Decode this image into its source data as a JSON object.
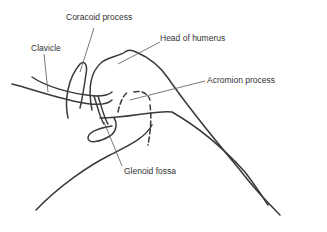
{
  "diagram": {
    "labels": [
      {
        "id": "coracoid",
        "text": "Coracoid process"
      },
      {
        "id": "clavicle",
        "text": "Clavicle"
      },
      {
        "id": "head-humerus",
        "text": "Head of humerus"
      },
      {
        "id": "acromion",
        "text": "Acromion process"
      },
      {
        "id": "glenoid",
        "text": "Glenoid fossa"
      }
    ],
    "colors": {
      "line": "#3a3a3a",
      "text": "#333333",
      "background": "#ffffff"
    }
  }
}
